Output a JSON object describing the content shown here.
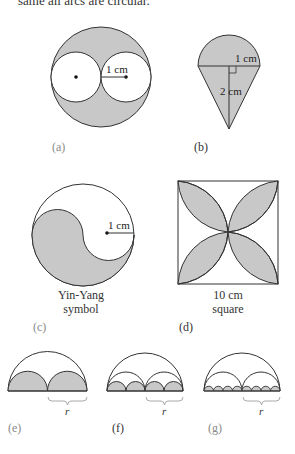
{
  "header": {
    "text": "same all arcs are circular."
  },
  "colors": {
    "shade": "#c8c8c8",
    "stroke": "#333333",
    "brace": "#aaaaaa"
  },
  "figures": {
    "a": {
      "label": "(a)",
      "dimension": "1 cm"
    },
    "b": {
      "label": "(b)",
      "dimension_radius": "1 cm",
      "dimension_height": "2 cm"
    },
    "c": {
      "label": "(c)",
      "dimension": "1 cm",
      "caption_line1": "Yin-Yang",
      "caption_line2": "symbol"
    },
    "d": {
      "label": "(d)",
      "caption_line1": "10 cm",
      "caption_line2": "square"
    },
    "e": {
      "label": "(e)",
      "brace_label": "r"
    },
    "f": {
      "label": "(f)",
      "brace_label": "r"
    },
    "g": {
      "label": "(g)",
      "brace_label": "r"
    }
  }
}
